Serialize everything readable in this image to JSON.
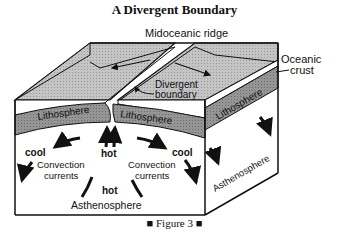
{
  "title": "A Divergent Boundary",
  "caption": "■ Figure 3 ■",
  "labels": {
    "ridge": "Midoceanic ridge",
    "oceanic": "Oceanic",
    "crust": "crust",
    "divergent": "Divergent",
    "boundary": "boundary",
    "lith_left": "Lithosphere",
    "lith_mid": "Lithosphere",
    "lith_right": "Lithosphere",
    "cool_left": "cool",
    "cool_right": "cool",
    "hot_top": "hot",
    "hot_bottom": "hot",
    "conv_left_1": "Convection",
    "conv_left_2": "currents",
    "conv_right_1": "Convection",
    "conv_right_2": "currents",
    "astheno_front": "Asthenosphere",
    "astheno_side": "Asthenosphere"
  },
  "colors": {
    "crust_fill": "#bdbdbd",
    "lithosphere_fill": "#8f8f8f",
    "outline": "#111111",
    "background": "#ffffff"
  }
}
